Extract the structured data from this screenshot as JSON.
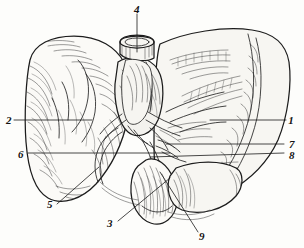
{
  "figure": {
    "medium": "engraving",
    "background_color": "#fdfdfb",
    "ink_color": "#1c1c1c",
    "width": 304,
    "height": 248
  },
  "labels": [
    {
      "id": "1",
      "text": "1",
      "x": 291,
      "y": 122,
      "name": "label-1",
      "leader": "M 210,120 L 286,120"
    },
    {
      "id": "2",
      "text": "2",
      "x": 5,
      "y": 124,
      "name": "label-2",
      "leader": "M 14,120 L 92,120"
    },
    {
      "id": "3",
      "text": "3",
      "x": 106,
      "y": 226,
      "name": "label-3",
      "leader": "M 118,221 L 170,178"
    },
    {
      "id": "4",
      "text": "4",
      "x": 132,
      "y": 13,
      "name": "label-4",
      "leader": "M 137,14 L 137,52"
    },
    {
      "id": "5",
      "text": "5",
      "x": 46,
      "y": 208,
      "name": "label-5",
      "leader": "M 57,204 L 99,167"
    },
    {
      "id": "6",
      "text": "6",
      "x": 18,
      "y": 158,
      "name": "label-6",
      "leader": "M 28,153 L 170,153"
    },
    {
      "id": "7",
      "text": "7",
      "x": 289,
      "y": 147,
      "name": "label-7",
      "leader": "M 166,144 L 284,144"
    },
    {
      "id": "8",
      "text": "8",
      "x": 289,
      "y": 157,
      "name": "label-8",
      "leader": "M 150,157 L 284,153"
    },
    {
      "id": "9",
      "text": "9",
      "x": 200,
      "y": 238,
      "name": "label-9",
      "leader": "M 198,232 L 160,172"
    }
  ]
}
